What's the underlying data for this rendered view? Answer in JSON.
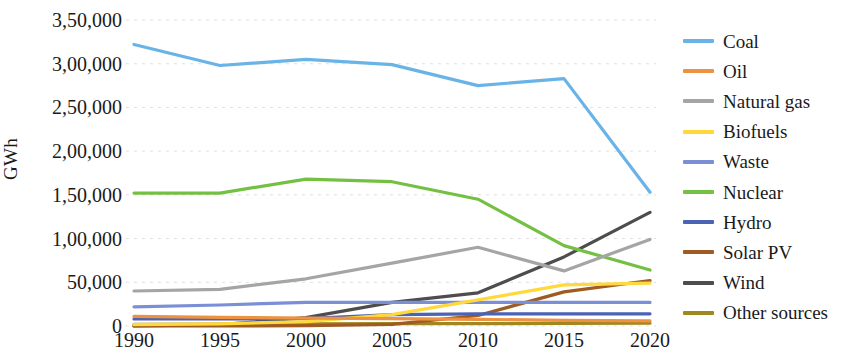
{
  "chart_data": {
    "type": "line",
    "title": "",
    "xlabel": "",
    "ylabel": "GWh",
    "x": [
      1990,
      1995,
      2000,
      2005,
      2010,
      2015,
      2020
    ],
    "xtick_labels": [
      "1990",
      "1995",
      "2000",
      "2005",
      "2010",
      "2015",
      "2020"
    ],
    "ytick_labels": [
      "0",
      "50,000",
      "1,00,000",
      "1,50,000",
      "2,00,000",
      "2,50,000",
      "3,00,000",
      "3,50,000"
    ],
    "ytick_values": [
      0,
      50000,
      100000,
      150000,
      200000,
      250000,
      300000,
      350000
    ],
    "ylim": [
      0,
      350000
    ],
    "xlim": [
      1990,
      2020
    ],
    "grid": true,
    "legend_position": "right",
    "series": [
      {
        "name": "Coal",
        "color": "#69b3e7",
        "values": [
          322000,
          298000,
          305000,
          299000,
          275000,
          283000,
          153000
        ]
      },
      {
        "name": "Oil",
        "color": "#ed9242",
        "values": [
          11000,
          10000,
          9000,
          8500,
          7500,
          6500,
          6000
        ]
      },
      {
        "name": "Natural gas",
        "color": "#a5a5a5",
        "values": [
          40000,
          42000,
          54000,
          72000,
          90000,
          63000,
          99000
        ]
      },
      {
        "name": "Biofuels",
        "color": "#ffd93b",
        "values": [
          1500,
          2500,
          5000,
          13000,
          30000,
          47000,
          49000
        ]
      },
      {
        "name": "Waste",
        "color": "#7a8fd6",
        "values": [
          22000,
          24000,
          27000,
          27000,
          27000,
          27000,
          27000
        ]
      },
      {
        "name": "Nuclear",
        "color": "#74c043",
        "values": [
          152000,
          152000,
          168000,
          165000,
          145000,
          92000,
          64000
        ]
      },
      {
        "name": "Hydro",
        "color": "#4a63b5",
        "values": [
          8000,
          8000,
          8500,
          13000,
          14000,
          14000,
          14000
        ]
      },
      {
        "name": "Solar PV",
        "color": "#9e5b22",
        "values": [
          0,
          100,
          300,
          2000,
          12000,
          39000,
          52000
        ]
      },
      {
        "name": "Wind",
        "color": "#4d4d4d",
        "values": [
          100,
          1500,
          9500,
          27000,
          38000,
          79000,
          130000
        ]
      },
      {
        "name": "Other sources",
        "color": "#a08820",
        "values": [
          2000,
          2200,
          2400,
          2600,
          2800,
          3000,
          3200
        ]
      }
    ]
  }
}
